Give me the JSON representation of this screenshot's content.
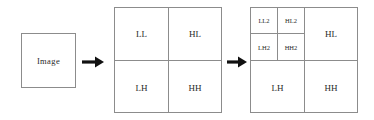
{
  "diagram": {
    "source": {
      "label": "Image"
    },
    "arrows": [
      {
        "name": "arrow-1",
        "glyph": "right-arrow-icon"
      },
      {
        "name": "arrow-2",
        "glyph": "right-arrow-icon"
      }
    ],
    "level1": {
      "name": "first-level-decomposition",
      "quadrants": {
        "ll": "LL",
        "hl": "HL",
        "lh": "LH",
        "hh": "HH"
      }
    },
    "level2": {
      "name": "second-level-decomposition",
      "quadrants": {
        "hl": "HL",
        "lh": "LH",
        "hh": "HH"
      },
      "subbands": {
        "ll2": "LL2",
        "hl2": "HL2",
        "lh2": "LH2",
        "hh2": "HH2"
      }
    },
    "colors": {
      "border": "#8c8c8c",
      "text": "#2a2a2a",
      "arrow": "#111111",
      "background": "#ffffff"
    }
  }
}
